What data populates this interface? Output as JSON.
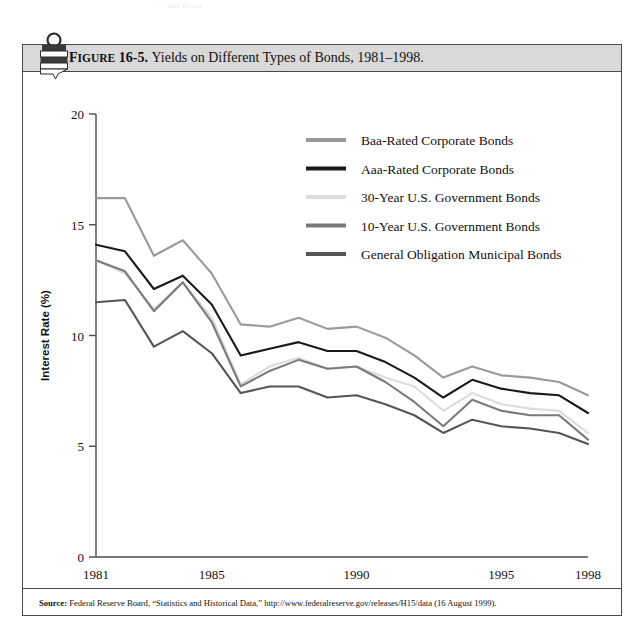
{
  "page": {
    "top_cropped_text": "mic Bonds"
  },
  "figure": {
    "label": "FIGURE 16-5.",
    "label_prefix": "F",
    "label_smallcaps": "IGURE",
    "label_number": " 16-5.",
    "title": "Yields on Different Types of Bonds, 1981–1998.",
    "clip_icon": "bookmark-clip-icon"
  },
  "source": {
    "prefix": "Source:",
    "text": "Federal Reserve Board, “Statistics and Historical Data,” http://www.federalreserve.gov/releases/H15/data (16 August 1999)."
  },
  "colors": {
    "baa": "#9a9a9a",
    "aaa": "#1a1a1a",
    "gov30": "#dcdcdc",
    "gov10": "#7a7a7a",
    "muni": "#555555",
    "axis": "#4a4a4a",
    "titlebar": "#d9d9d9",
    "frame": "#4a4a4a"
  },
  "chart_data": {
    "type": "line",
    "title": "Yields on Different Types of Bonds, 1981–1998.",
    "xlabel": "Year",
    "ylabel": "Interest Rate (%)",
    "xlim": [
      1981,
      1998
    ],
    "ylim": [
      0,
      20
    ],
    "xticks": [
      1981,
      1985,
      1990,
      1995,
      1998
    ],
    "yticks": [
      0,
      5,
      10,
      15,
      20
    ],
    "grid": false,
    "legend_position": "upper-right-inside",
    "x": [
      1981,
      1982,
      1983,
      1984,
      1985,
      1986,
      1987,
      1988,
      1989,
      1990,
      1991,
      1992,
      1993,
      1994,
      1995,
      1996,
      1997,
      1998
    ],
    "series": [
      {
        "name": "Baa-Rated Corporate Bonds",
        "color": "#9a9a9a",
        "values": [
          16.2,
          16.2,
          13.6,
          14.3,
          12.8,
          10.5,
          10.4,
          10.8,
          10.3,
          10.4,
          9.9,
          9.1,
          8.1,
          8.6,
          8.2,
          8.1,
          7.9,
          7.3
        ]
      },
      {
        "name": "Aaa-Rated Corporate Bonds",
        "color": "#1a1a1a",
        "values": [
          14.1,
          13.8,
          12.1,
          12.7,
          11.4,
          9.1,
          9.4,
          9.7,
          9.3,
          9.3,
          8.8,
          8.1,
          7.2,
          8.0,
          7.6,
          7.4,
          7.3,
          6.5
        ]
      },
      {
        "name": "30-Year U.S. Government Bonds",
        "color": "#dcdcdc",
        "values": [
          13.4,
          12.8,
          11.2,
          12.4,
          10.8,
          7.8,
          8.6,
          9.0,
          8.5,
          8.6,
          8.1,
          7.7,
          6.6,
          7.4,
          6.9,
          6.7,
          6.6,
          5.6
        ]
      },
      {
        "name": "10-Year U.S. Government Bonds",
        "color": "#7a7a7a",
        "values": [
          13.4,
          12.9,
          11.1,
          12.4,
          10.6,
          7.7,
          8.4,
          8.9,
          8.5,
          8.6,
          7.9,
          7.0,
          5.9,
          7.1,
          6.6,
          6.4,
          6.4,
          5.3
        ]
      },
      {
        "name": "General Obligation Municipal Bonds",
        "color": "#555555",
        "values": [
          11.5,
          11.6,
          9.5,
          10.2,
          9.2,
          7.4,
          7.7,
          7.7,
          7.2,
          7.3,
          6.9,
          6.4,
          5.6,
          6.2,
          5.9,
          5.8,
          5.6,
          5.1
        ]
      }
    ]
  },
  "legend": {
    "items": [
      {
        "label": "Baa-Rated Corporate Bonds",
        "color": "#9a9a9a"
      },
      {
        "label": "Aaa-Rated Corporate Bonds",
        "color": "#1a1a1a"
      },
      {
        "label": "30-Year U.S. Government Bonds",
        "color": "#dcdcdc"
      },
      {
        "label": "10-Year U.S. Government Bonds",
        "color": "#7a7a7a"
      },
      {
        "label": "General Obligation Municipal Bonds",
        "color": "#555555"
      }
    ]
  }
}
